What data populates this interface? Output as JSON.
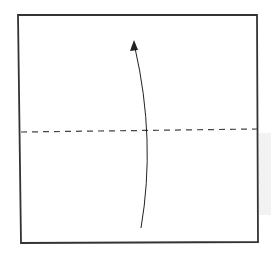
{
  "diagram": {
    "type": "origami-step",
    "title": "Valley fold: fold bottom edge up to top edge",
    "paper": {
      "shape": "square",
      "corners": [
        [
          18,
          15
        ],
        [
          257,
          15
        ],
        [
          258,
          242
        ],
        [
          21,
          243
        ]
      ],
      "stroke_color": "#333333",
      "fill_color": "#ffffff"
    },
    "fold_line": {
      "style": "dashed",
      "kind": "valley-fold",
      "from": [
        21,
        132
      ],
      "to": [
        257,
        129
      ],
      "color": "#444444"
    },
    "arrow": {
      "direction": "up",
      "meaning": "fold bottom half up",
      "path": "M141,228 Q156,140 134,44",
      "tip": [
        134,
        41
      ],
      "color": "#222222"
    },
    "shadow": {
      "color": "#f2f2f2"
    }
  }
}
